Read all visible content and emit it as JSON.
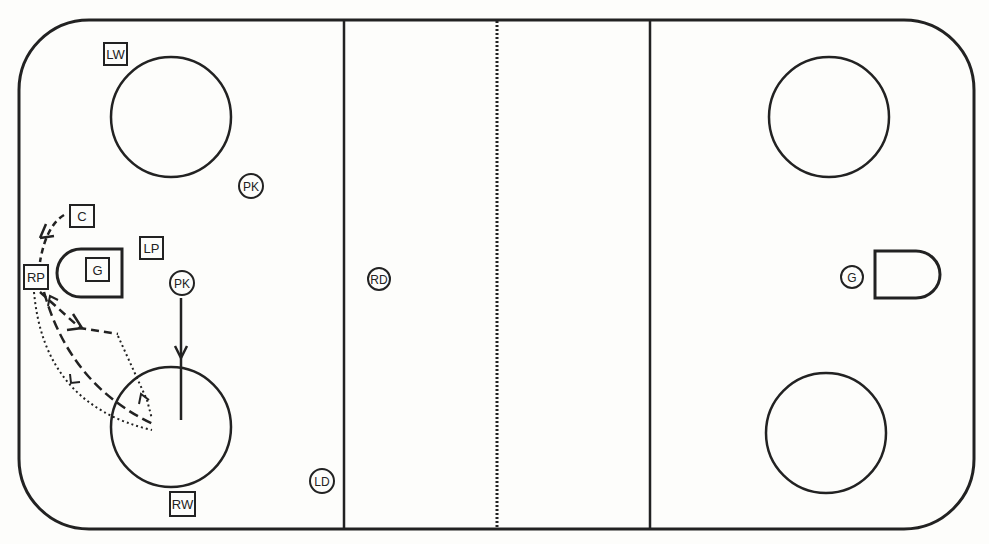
{
  "diagram": {
    "type": "hockey-rink-play",
    "colors": {
      "ink": "#222222",
      "ice": "#fdfdfb"
    }
  },
  "rink": {
    "boards": {
      "x": 19,
      "y": 20,
      "width": 955,
      "height": 509,
      "corner_radius": 70
    },
    "lines": {
      "left_blue_line_x": 344,
      "center_red_line_x": 497,
      "right_blue_line_x": 650
    },
    "faceoff_circles": [
      {
        "id": "left-top",
        "cx": 171,
        "cy": 117,
        "r": 60
      },
      {
        "id": "left-bottom",
        "cx": 171,
        "cy": 427,
        "r": 60
      },
      {
        "id": "right-top",
        "cx": 829,
        "cy": 117,
        "r": 60
      },
      {
        "id": "right-bottom",
        "cx": 826,
        "cy": 433,
        "r": 60
      }
    ],
    "goal_creases": [
      {
        "id": "left-crease",
        "side": "left",
        "x1": 57,
        "x2": 122,
        "y1": 249,
        "y2": 297
      },
      {
        "id": "right-crease",
        "side": "right",
        "x1": 875,
        "x2": 940,
        "y1": 251,
        "y2": 298
      }
    ]
  },
  "players": {
    "attackers_square": [
      {
        "id": "lw",
        "label": "LW",
        "x": 104,
        "y": 43
      },
      {
        "id": "c",
        "label": "C",
        "x": 70,
        "y": 205
      },
      {
        "id": "lp",
        "label": "LP",
        "x": 140,
        "y": 237
      },
      {
        "id": "g-left",
        "label": "G",
        "x": 86,
        "y": 258
      },
      {
        "id": "rp",
        "label": "RP",
        "x": 24,
        "y": 265
      },
      {
        "id": "rw",
        "label": "RW",
        "x": 170,
        "y": 492
      }
    ],
    "defenders_circle": [
      {
        "id": "pk-top",
        "label": "PK",
        "cx": 251,
        "cy": 186
      },
      {
        "id": "pk-mid",
        "label": "PK",
        "cx": 182,
        "cy": 283
      },
      {
        "id": "rd",
        "label": "RD",
        "cx": 379,
        "cy": 279
      },
      {
        "id": "ld",
        "label": "LD",
        "cx": 322,
        "cy": 481
      },
      {
        "id": "g-right",
        "label": "G",
        "cx": 852,
        "cy": 277
      }
    ]
  },
  "paths": [
    {
      "id": "c-to-rp",
      "style": "dashed",
      "d": "M 64 215 Q 45 228 40 263",
      "arrow": "at-rp-area"
    },
    {
      "id": "rp-skate-short",
      "style": "dashed",
      "d": "M 40 292 L 82 330 L 118 334"
    },
    {
      "id": "rp-skate-long",
      "style": "dashed",
      "d": "M 42 292 Q 70 380 152 423"
    },
    {
      "id": "rp-pass-outer",
      "style": "dotted",
      "d": "M 34 292 Q 45 400 150 430"
    },
    {
      "id": "rp-pass-return",
      "style": "dotted",
      "d": "M 120 336 L 148 400 L 152 418"
    },
    {
      "id": "pk-to-circle",
      "style": "solid",
      "d": "M 181 298 L 181 420"
    }
  ]
}
